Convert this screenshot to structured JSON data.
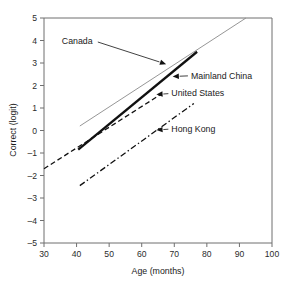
{
  "chart_data": {
    "type": "line",
    "title": "",
    "xlabel": "Age (months)",
    "ylabel": "Correct (logit)",
    "xlim": [
      30,
      100
    ],
    "ylim": [
      -5,
      5
    ],
    "xticks": [
      30,
      40,
      50,
      60,
      70,
      80,
      90,
      100
    ],
    "yticks": [
      5,
      4,
      3,
      2,
      1,
      0,
      -1,
      -2,
      -3,
      -4,
      -5
    ],
    "xtick_labels": [
      "30",
      "40",
      "50",
      "60",
      "70",
      "80",
      "90",
      "100"
    ],
    "ytick_labels": [
      "5",
      "4",
      "3",
      "2",
      "1",
      "0",
      "–1",
      "–2",
      "–3",
      "–4",
      "–5"
    ],
    "grid": false,
    "legend": "inline-annotations",
    "series": [
      {
        "name": "Canada",
        "style": "solid-thin",
        "color": "#8a8a8a",
        "x": [
          41.0,
          92.0
        ],
        "y": [
          0.2,
          5.0
        ],
        "annotation": {
          "label": "Canada",
          "point_x": 67.5,
          "point_y": 2.95,
          "label_x": 41.0,
          "label_y": 4.0
        }
      },
      {
        "name": "Mainland China",
        "style": "solid-thick",
        "color": "#111111",
        "x": [
          40.5,
          77.0
        ],
        "y": [
          -0.85,
          3.5
        ],
        "annotation": {
          "label": "Mainland China",
          "point_x": 69.5,
          "point_y": 2.4,
          "label_x": 88.0,
          "label_y": 2.45
        }
      },
      {
        "name": "United States",
        "style": "dashed",
        "color": "#111111",
        "x": [
          30.0,
          66.0
        ],
        "y": [
          -1.7,
          1.62
        ],
        "annotation": {
          "label": "United States",
          "point_x": 64.5,
          "point_y": 1.6,
          "label_x": 82.0,
          "label_y": 1.66
        }
      },
      {
        "name": "Hong Kong",
        "style": "dash-dot",
        "color": "#111111",
        "x": [
          41.0,
          76.0
        ],
        "y": [
          -2.45,
          1.2
        ],
        "annotation": {
          "label": "Hong Kong",
          "point_x": 64.5,
          "point_y": 0.02,
          "label_x": 82.0,
          "label_y": 0.08
        }
      }
    ]
  },
  "axes": {
    "x_title": "Age (months)",
    "y_title": "Correct (logit)"
  }
}
